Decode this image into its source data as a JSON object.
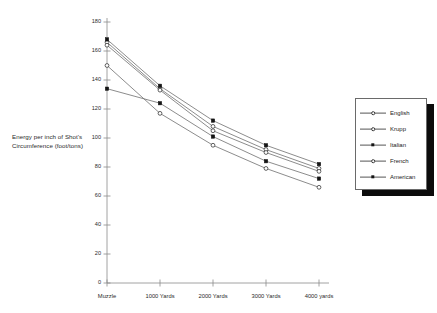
{
  "chart_data": {
    "type": "line",
    "title": "",
    "xlabel": "",
    "ylabel": "Energy per inch of Shot's Circumference (foot/tons)",
    "categories": [
      "Muzzle",
      "1000 Yards",
      "2000 Yards",
      "3000 Yards",
      "4000 yards"
    ],
    "ylim": [
      0,
      180
    ],
    "ytick_values": [
      0,
      20,
      40,
      60,
      80,
      100,
      120,
      140,
      160,
      180
    ],
    "ytick_labels": [
      "0",
      "20",
      "40",
      "60",
      "80",
      "100",
      "120",
      "140",
      "160",
      "180"
    ],
    "grid": false,
    "legend_position": "right",
    "series": [
      {
        "name": "English",
        "marker": "open-circle",
        "color": "#4a4a4a",
        "values": [
          166,
          134,
          108,
          92,
          79
        ]
      },
      {
        "name": "Krupp",
        "marker": "open-circle",
        "color": "#4a4a4a",
        "values": [
          164,
          133,
          105,
          90,
          77
        ]
      },
      {
        "name": "Italian",
        "marker": "filled-square",
        "color": "#333333",
        "values": [
          168,
          136,
          112,
          95,
          82
        ]
      },
      {
        "name": "French",
        "marker": "open-circle",
        "color": "#4a4a4a",
        "values": [
          150,
          117,
          95,
          79,
          66
        ]
      },
      {
        "name": "American",
        "marker": "filled-square",
        "color": "#333333",
        "values": [
          134,
          124,
          101,
          84,
          72
        ]
      }
    ]
  },
  "legend": {
    "entries": [
      {
        "label": "English",
        "marker": "open-circle"
      },
      {
        "label": "Krupp",
        "marker": "open-circle"
      },
      {
        "label": "Italian",
        "marker": "filled-square"
      },
      {
        "label": "French",
        "marker": "open-circle"
      },
      {
        "label": "American",
        "marker": "filled-square"
      }
    ]
  },
  "colors": {
    "axis": "#8a8a8a",
    "line": "#6f6f6f",
    "marker_fill": "#151515",
    "text": "#222222",
    "legend_shadow": "#0c0c0c",
    "legend_border": "#6a6a6a",
    "background": "#ffffff"
  }
}
